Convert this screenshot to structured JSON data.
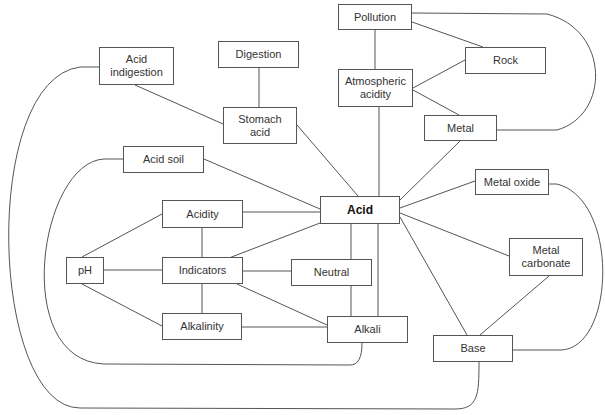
{
  "diagram": {
    "type": "concept-map",
    "central_concept": "Acid",
    "nodes": {
      "pollution": {
        "label": "Pollution",
        "x": 338,
        "y": 4,
        "w": 74,
        "h": 26
      },
      "rock": {
        "label": "Rock",
        "x": 465,
        "y": 47,
        "w": 81,
        "h": 27
      },
      "digestion": {
        "label": "Digestion",
        "x": 218,
        "y": 41,
        "w": 81,
        "h": 27
      },
      "acid_indigestion": {
        "label": "Acid\nindigestion",
        "x": 99,
        "y": 47,
        "w": 75,
        "h": 38
      },
      "atmospheric_acidity": {
        "label": "Atmospheric\nacidity",
        "x": 338,
        "y": 69,
        "w": 75,
        "h": 38
      },
      "stomach_acid": {
        "label": "Stomach\nacid",
        "x": 223,
        "y": 107,
        "w": 74,
        "h": 37
      },
      "metal": {
        "label": "Metal",
        "x": 424,
        "y": 115,
        "w": 73,
        "h": 26
      },
      "acid_soil": {
        "label": "Acid soil",
        "x": 123,
        "y": 146,
        "w": 81,
        "h": 27
      },
      "metal_oxide": {
        "label": "Metal oxide",
        "x": 475,
        "y": 169,
        "w": 74,
        "h": 26
      },
      "acid": {
        "label": "Acid",
        "x": 320,
        "y": 196,
        "w": 80,
        "h": 28
      },
      "acidity": {
        "label": "Acidity",
        "x": 162,
        "y": 200,
        "w": 81,
        "h": 28
      },
      "metal_carbonate": {
        "label": "Metal\ncarbonate",
        "x": 509,
        "y": 238,
        "w": 74,
        "h": 38
      },
      "ph": {
        "label": "pH",
        "x": 66,
        "y": 257,
        "w": 38,
        "h": 27
      },
      "indicators": {
        "label": "Indicators",
        "x": 162,
        "y": 257,
        "w": 81,
        "h": 27
      },
      "neutral": {
        "label": "Neutral",
        "x": 291,
        "y": 259,
        "w": 81,
        "h": 27
      },
      "alkalinity": {
        "label": "Alkalinity",
        "x": 162,
        "y": 313,
        "w": 80,
        "h": 27
      },
      "alkali": {
        "label": "Alkali",
        "x": 327,
        "y": 316,
        "w": 81,
        "h": 27
      },
      "base": {
        "label": "Base",
        "x": 433,
        "y": 335,
        "w": 80,
        "h": 27
      }
    },
    "edges": [
      [
        "pollution",
        "atmospheric_acidity"
      ],
      [
        "pollution",
        "rock"
      ],
      [
        "pollution",
        "metal"
      ],
      [
        "atmospheric_acidity",
        "rock"
      ],
      [
        "atmospheric_acidity",
        "metal"
      ],
      [
        "atmospheric_acidity",
        "acid"
      ],
      [
        "digestion",
        "stomach_acid"
      ],
      [
        "acid_indigestion",
        "stomach_acid"
      ],
      [
        "acid_indigestion",
        "base"
      ],
      [
        "stomach_acid",
        "acid"
      ],
      [
        "metal",
        "acid"
      ],
      [
        "acid_soil",
        "acid"
      ],
      [
        "acid_soil",
        "alkali"
      ],
      [
        "metal_oxide",
        "acid"
      ],
      [
        "metal_oxide",
        "base"
      ],
      [
        "acidity",
        "acid"
      ],
      [
        "acidity",
        "indicators"
      ],
      [
        "acidity",
        "ph"
      ],
      [
        "indicators",
        "acid"
      ],
      [
        "indicators",
        "ph"
      ],
      [
        "indicators",
        "neutral"
      ],
      [
        "indicators",
        "alkalinity"
      ],
      [
        "indicators",
        "alkali"
      ],
      [
        "ph",
        "alkalinity"
      ],
      [
        "alkalinity",
        "alkali"
      ],
      [
        "neutral",
        "alkali"
      ],
      [
        "acid",
        "neutral"
      ],
      [
        "acid",
        "alkali"
      ],
      [
        "acid",
        "metal_carbonate"
      ],
      [
        "acid",
        "base"
      ],
      [
        "metal_carbonate",
        "base"
      ]
    ]
  }
}
